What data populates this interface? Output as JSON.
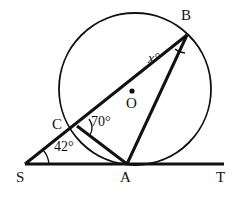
{
  "figure": {
    "type": "circle-geometry-diagram",
    "stroke_color": "#111111",
    "background_color": "#ffffff",
    "points": {
      "S": {
        "x": 25,
        "y": 164,
        "label": "S",
        "label_x": 16,
        "label_y": 170
      },
      "A": {
        "x": 127,
        "y": 164,
        "label": "A",
        "label_x": 120,
        "label_y": 170
      },
      "T": {
        "x": 224,
        "y": 164,
        "label": "T",
        "label_x": 216,
        "label_y": 170
      },
      "B": {
        "x": 187,
        "y": 35,
        "label": "B",
        "label_x": 181,
        "label_y": 10
      },
      "C": {
        "x": 77,
        "y": 126,
        "label": "C",
        "label_x": 52,
        "label_y": 118
      },
      "O": {
        "x": 132,
        "y": 91,
        "label": "O",
        "label_x": 126,
        "label_y": 96
      }
    },
    "circle": {
      "cx": 135,
      "cy": 89,
      "r": 76
    },
    "segments": [
      {
        "name": "line-ST",
        "from": "S",
        "to": "T"
      },
      {
        "name": "secant-SB",
        "from": "S",
        "to": "B"
      },
      {
        "name": "chord-CA",
        "from": "C",
        "to": "A"
      },
      {
        "name": "chord-AB",
        "from": "A",
        "to": "B"
      }
    ],
    "angles": [
      {
        "name": "angle-at-S",
        "value": "42°",
        "vertex": "S",
        "label_x": 54,
        "label_y": 142
      },
      {
        "name": "angle-at-C",
        "value": "70°",
        "vertex": "C",
        "label_x": 91,
        "label_y": 117
      },
      {
        "name": "angle-at-B",
        "value": "x°",
        "vertex": "B",
        "label_x": 148,
        "label_y": 53
      }
    ]
  }
}
